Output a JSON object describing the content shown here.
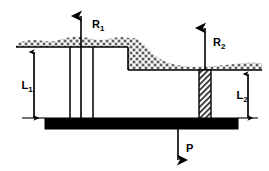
{
  "figure": {
    "background_color": "#ffffff",
    "ink_color": "#000000",
    "width": 269,
    "height": 171
  },
  "labels": {
    "reaction_1": {
      "base": "R",
      "sub": "1",
      "text": "R1"
    },
    "reaction_2": {
      "base": "R",
      "sub": "2",
      "text": "R2"
    },
    "length_1": {
      "base": "L",
      "sub": "1",
      "text": "L1"
    },
    "length_2": {
      "base": "L",
      "sub": "2",
      "text": "L2"
    },
    "load": {
      "base": "P",
      "sub": "",
      "text": "P"
    }
  },
  "elements": {
    "upper_ground_line": "upper-ground-surface",
    "lower_ground_line": "lower-ground-surface",
    "step_riser": "excavation-step-riser",
    "soil_slope": "soil-slope-wedge",
    "slab": "foundation-slab",
    "pile_left_a": "left-pile-a",
    "pile_left_b": "left-pile-b",
    "pile_right_hatched": "right-hatched-pile",
    "arrow_r1": "reaction-arrow-r1",
    "arrow_r2": "reaction-arrow-r2",
    "arrow_p": "load-arrow-p",
    "dim_l1": "dimension-arrow-l1",
    "dim_l2": "dimension-arrow-l2"
  },
  "geometry": {
    "upper_ground_y": 47,
    "lower_ground_y": 70,
    "slab_top_y": 118,
    "slab_bottom_y": 128,
    "slab_left_x": 45,
    "slab_right_x": 238,
    "step_x": 128,
    "upper_ground_left_x": 16,
    "lower_ground_right_x": 262
  }
}
